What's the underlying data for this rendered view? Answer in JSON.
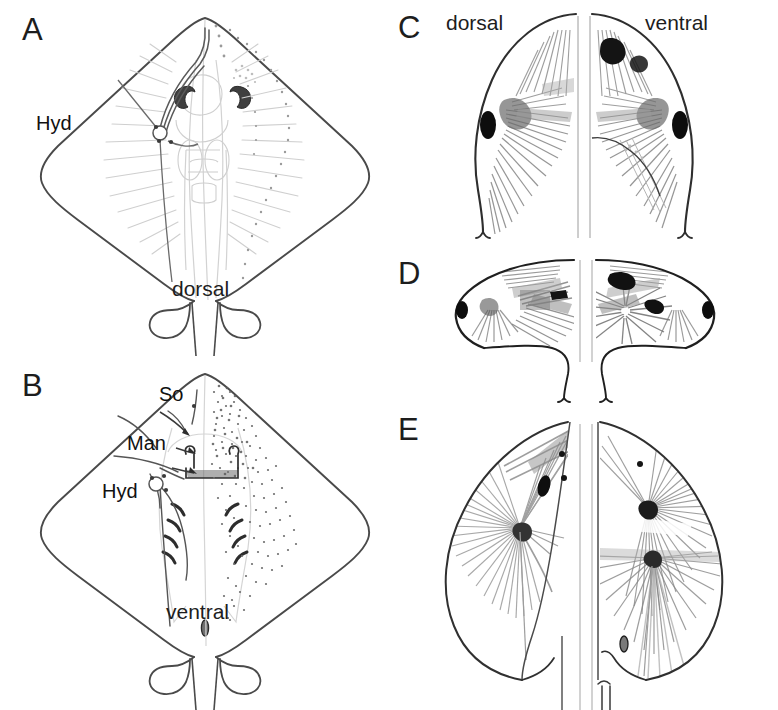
{
  "figure": {
    "caption_panels": [
      "A",
      "B",
      "C",
      "D",
      "E"
    ],
    "background_color": "#ffffff",
    "line_color": "#3a3a3a",
    "faint_line_color": "#c9c9c9",
    "fiber_color": "#8c8c8c",
    "dark_mark_color": "#111111"
  },
  "panels": {
    "a": {
      "letter": "A",
      "view_label": "dorsal",
      "annotations": [
        {
          "key": "hyd",
          "label": "Hyd"
        }
      ],
      "description": "dorsal schematic of ray body outline with hyoid nerve branches"
    },
    "b": {
      "letter": "B",
      "view_label": "ventral",
      "annotations": [
        {
          "key": "so",
          "label": "So"
        },
        {
          "key": "man",
          "label": "Man"
        },
        {
          "key": "hyd",
          "label": "Hyd"
        }
      ],
      "description": "ventral schematic of ray body outline with suborbital, mandibular and hyoid branches"
    },
    "c": {
      "letter": "C",
      "left_label": "dorsal",
      "right_label": "ventral",
      "description": "paired specimen halves, dorsal left and ventral right"
    },
    "d": {
      "letter": "D",
      "description": "paired lateral specimen halves with eye spots"
    },
    "e": {
      "letter": "E",
      "description": "paired specimen halves with radiating fiber fans"
    }
  }
}
